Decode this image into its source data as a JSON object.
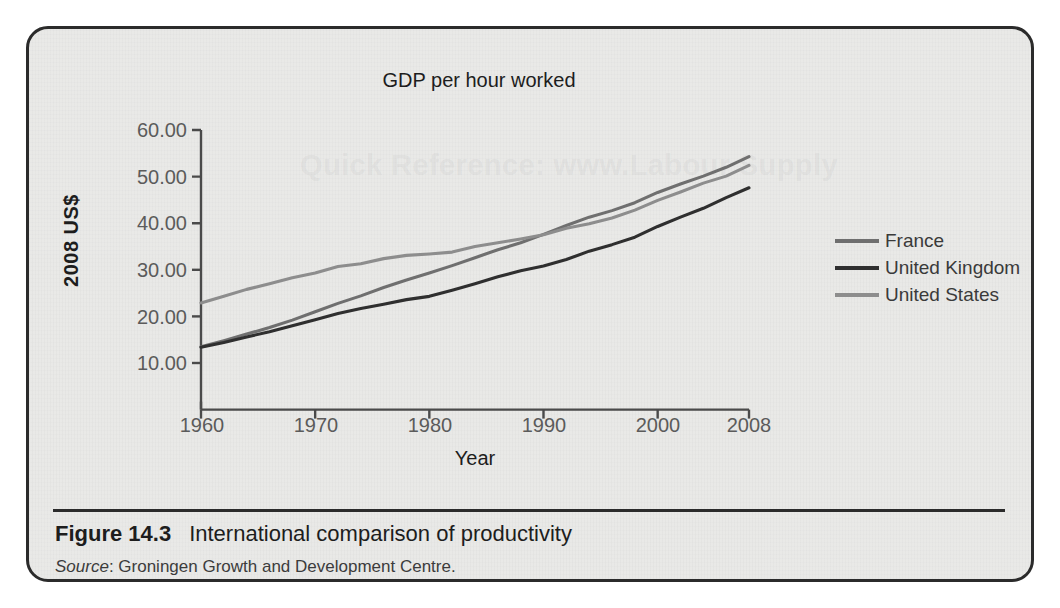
{
  "figure": {
    "number_label": "Figure 14.3",
    "caption": "International comparison of productivity",
    "source_word": "Source",
    "source_text": ": Groningen Growth and Development Centre.",
    "watermark": "Quick Reference: www.Labour Supply"
  },
  "colors": {
    "page_background": "#ffffff",
    "panel_background": "#e9e9e7",
    "panel_border": "#2b2b2b",
    "axis": "#4a4a4a",
    "france": "#6f6f6f",
    "united_kingdom": "#2f2f2f",
    "united_states": "#8d8d8d"
  },
  "legend": {
    "position": "right",
    "entries": [
      {
        "label": "France",
        "color": "#6f6f6f"
      },
      {
        "label": "United Kingdom",
        "color": "#2f2f2f"
      },
      {
        "label": "United States",
        "color": "#8d8d8d"
      }
    ]
  },
  "chart_data": {
    "type": "line",
    "title": "GDP per hour worked",
    "xlabel": "Year",
    "ylabel": "2008 US$",
    "xlim": [
      1960,
      2008
    ],
    "ylim": [
      0,
      60
    ],
    "grid": false,
    "xticks": [
      "1960",
      "1970",
      "1980",
      "1990",
      "2000",
      "2008"
    ],
    "xtick_values": [
      1960,
      1970,
      1980,
      1990,
      2000,
      2008
    ],
    "yticks": [
      "10.00",
      "20.00",
      "30.00",
      "40.00",
      "50.00",
      "60.00"
    ],
    "ytick_values": [
      10,
      20,
      30,
      40,
      50,
      60
    ],
    "x": [
      1960,
      1962,
      1964,
      1966,
      1968,
      1970,
      1972,
      1974,
      1976,
      1978,
      1980,
      1982,
      1984,
      1986,
      1988,
      1990,
      1992,
      1994,
      1996,
      1998,
      2000,
      2002,
      2004,
      2006,
      2008
    ],
    "series": [
      {
        "name": "France",
        "color": "#6f6f6f",
        "values": [
          13.5,
          14.8,
          16.2,
          17.6,
          19.2,
          21.0,
          22.8,
          24.4,
          26.2,
          27.8,
          29.3,
          30.9,
          32.6,
          34.3,
          35.8,
          37.6,
          39.5,
          41.3,
          42.7,
          44.4,
          46.6,
          48.4,
          50.1,
          52.0,
          54.3
        ]
      },
      {
        "name": "United Kingdom",
        "color": "#2f2f2f",
        "values": [
          13.4,
          14.4,
          15.6,
          16.7,
          18.0,
          19.3,
          20.6,
          21.7,
          22.6,
          23.6,
          24.3,
          25.6,
          27.0,
          28.5,
          29.8,
          30.8,
          32.2,
          34.0,
          35.4,
          37.0,
          39.3,
          41.3,
          43.2,
          45.5,
          47.6
        ]
      },
      {
        "name": "United States",
        "color": "#8d8d8d",
        "values": [
          22.9,
          24.3,
          25.8,
          27.0,
          28.3,
          29.3,
          30.7,
          31.3,
          32.4,
          33.1,
          33.4,
          33.8,
          35.0,
          35.8,
          36.6,
          37.5,
          38.9,
          39.9,
          41.1,
          42.8,
          44.9,
          46.7,
          48.6,
          50.1,
          52.4
        ]
      }
    ]
  }
}
